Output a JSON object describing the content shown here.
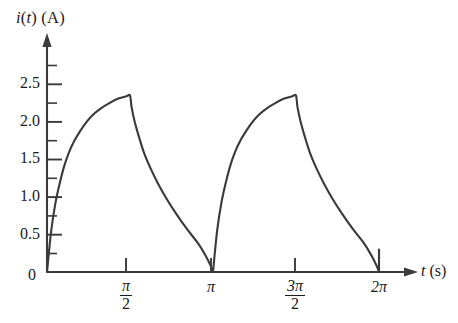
{
  "figure": {
    "background_color": "#ffffff",
    "ink_color": "#3a3a3a",
    "text_color": "#1a1a1a"
  },
  "axes": {
    "y_axis_label": "i(t) (A)",
    "y_axis_label_parts": {
      "quantity": "i",
      "variable": "t",
      "unit": "(A)"
    },
    "x_axis_label": "t (s)",
    "x_axis_label_parts": {
      "variable": "t",
      "unit": "(s)"
    },
    "origin_label": "0"
  },
  "y_ticks": [
    {
      "label": "0.5",
      "value": 0.5
    },
    {
      "label": "1.0",
      "value": 1.0
    },
    {
      "label": "1.5",
      "value": 1.5
    },
    {
      "label": "2.0",
      "value": 2.0
    },
    {
      "label": "2.5",
      "value": 2.5
    }
  ],
  "x_ticks": [
    {
      "label": "π/2",
      "numerator": "π",
      "denominator": "2",
      "value": 1.5708
    },
    {
      "label": "π",
      "numerator": "π",
      "denominator": "",
      "value": 3.1416
    },
    {
      "label": "3π/2",
      "numerator": "3π",
      "denominator": "2",
      "value": 4.7124
    },
    {
      "label": "2π",
      "numerator": "2π",
      "denominator": "",
      "value": 6.2832
    }
  ],
  "chart_data": {
    "type": "line",
    "title": "",
    "xlabel": "t (s)",
    "ylabel": "i(t) (A)",
    "xlim": [
      0,
      6.9
    ],
    "ylim": [
      0,
      2.75
    ],
    "grid": false,
    "legend": false,
    "peak_value": 2.35,
    "period": 3.1416,
    "series": [
      {
        "name": "i(t)",
        "x": [
          0.0,
          0.08,
          0.16,
          0.24,
          0.33,
          0.42,
          0.52,
          0.63,
          0.75,
          0.88,
          1.02,
          1.18,
          1.35,
          1.5,
          1.5708,
          1.6,
          1.66,
          1.74,
          1.84,
          1.96,
          2.1,
          2.26,
          2.44,
          2.64,
          2.86,
          3.0,
          3.1,
          3.1416,
          3.1416,
          3.22,
          3.3,
          3.38,
          3.47,
          3.56,
          3.66,
          3.77,
          3.89,
          4.02,
          4.16,
          4.32,
          4.49,
          4.64,
          4.7124,
          4.74,
          4.8,
          4.88,
          4.98,
          5.1,
          5.24,
          5.4,
          5.58,
          5.78,
          6.0,
          6.14,
          6.24,
          6.2832
        ],
        "y": [
          0.0,
          0.55,
          0.92,
          1.18,
          1.42,
          1.6,
          1.75,
          1.88,
          2.0,
          2.1,
          2.18,
          2.25,
          2.31,
          2.34,
          2.35,
          2.2,
          2.0,
          1.8,
          1.58,
          1.38,
          1.18,
          0.98,
          0.78,
          0.58,
          0.38,
          0.22,
          0.08,
          0.0,
          0.0,
          0.55,
          0.92,
          1.18,
          1.42,
          1.6,
          1.75,
          1.88,
          2.0,
          2.1,
          2.18,
          2.25,
          2.31,
          2.34,
          2.35,
          2.2,
          2.0,
          1.8,
          1.58,
          1.38,
          1.18,
          0.98,
          0.78,
          0.58,
          0.38,
          0.22,
          0.08,
          0.0
        ]
      }
    ],
    "end_marker": {
      "x": 6.2832,
      "y_from": 0.0,
      "y_to": 0.3,
      "note": "short vertical tick at 2pi"
    }
  }
}
